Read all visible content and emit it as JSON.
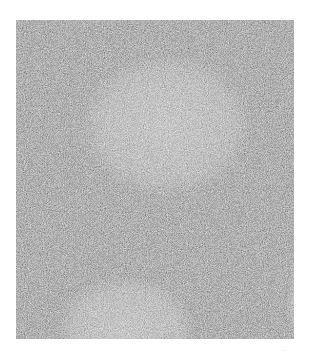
{
  "image": {
    "description": "Grayscale light micrograph of lymphoid tissue showing follicles with lighter germinal centers surrounded by concentric mantle zones of densely packed small lymphocytes",
    "colors": {
      "background": "#ffffff",
      "tissue_mid": "#7a7a7a",
      "germinal_center": "#9c9c9c",
      "dark_cells": "#3a3a3a"
    },
    "follicles": [
      {
        "name": "upper-follicle",
        "cx": 150,
        "cy": 105,
        "rx": 88,
        "ry": 72
      },
      {
        "name": "lower-left-follicle",
        "cx": 110,
        "cy": 310,
        "rx": 70,
        "ry": 55
      },
      {
        "name": "right-edge-follicle",
        "cx": 300,
        "cy": 280,
        "rx": 30,
        "ry": 60
      }
    ]
  },
  "caption": {
    "mark": "···"
  }
}
